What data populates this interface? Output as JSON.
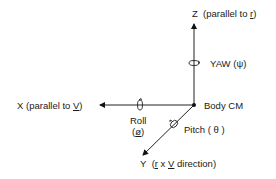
{
  "diagram": {
    "type": "coordinate-axes",
    "origin_label": "Body CM",
    "axes": [
      {
        "name": "Z",
        "prefix": "Z",
        "text_a": "(parallel to ",
        "vec": "r",
        "text_b": ")"
      },
      {
        "name": "X",
        "prefix": "X",
        "text_a": "(parallel to ",
        "vec": "V",
        "text_b": ")"
      },
      {
        "name": "Y",
        "prefix": "Y",
        "text_a": "(",
        "vec": "r",
        "mid": " x ",
        "vec2": "V",
        "text_b": " direction)"
      }
    ],
    "rotations": {
      "yaw": {
        "label": "YAW",
        "symbol": "(ψ)"
      },
      "roll": {
        "label": "Roll",
        "symbol": "ø"
      },
      "pitch": {
        "label": "Pitch",
        "symbol": "( θ )"
      }
    }
  }
}
